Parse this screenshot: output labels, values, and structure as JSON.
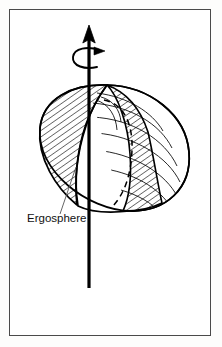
{
  "figure": {
    "kind": "line-diagram",
    "background_color": "#ffffff",
    "frame_color": "#4a4a4a",
    "ink_color": "#000000",
    "labels": [
      {
        "id": "ergosphere",
        "text": "Ergosphere",
        "x": 27,
        "y": 222,
        "font_size": 11.5,
        "leader_line": {
          "from_x": 60,
          "from_y": 214,
          "to_x": 75,
          "to_y": 168
        }
      }
    ],
    "elements": {
      "rotation_axis": {
        "name": "rotation-axis-arrow",
        "x": 89,
        "top_y": 26,
        "bottom_y": 288,
        "stroke_width": 3.2,
        "arrowhead": "up"
      },
      "spin_indicator": {
        "name": "spin-direction-arrow",
        "center_x": 89,
        "center_y": 57,
        "rx": 16,
        "ry": 8,
        "arrowhead": "right"
      },
      "ergosphere_surface": {
        "name": "ergosphere-ellipsoid",
        "center_x": 113,
        "center_y": 152,
        "semi_major": 76,
        "semi_minor": 66,
        "tilt_degrees": -18,
        "hatched_cutaway": true,
        "hatch_angle_degrees": 55,
        "hatch_spacing": 5,
        "latitude_lines": 7,
        "hidden_edge_style": "dashed"
      }
    }
  }
}
